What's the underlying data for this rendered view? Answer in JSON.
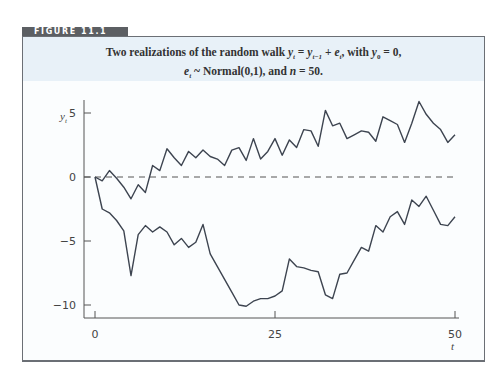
{
  "figure": {
    "tab_label": "FIGURE 11.1",
    "caption_line1_parts": [
      "Two realizations of the random walk ",
      "y",
      "t",
      " = ",
      "y",
      "t−1",
      " + ",
      "e",
      "t",
      ", with ",
      "y",
      "0",
      " = 0,"
    ],
    "caption_line2_parts": [
      "e",
      "t",
      " ~ Normal(0,1), and ",
      "n",
      " = 50."
    ],
    "colors": {
      "tab": "#5c5f63",
      "caption_bg": "#e8f1f8",
      "frame": "#6b6f75",
      "line": "#3d4450"
    }
  },
  "chart_data": {
    "type": "line",
    "xlabel": "t",
    "ylabel": "y_t",
    "xlim": [
      0,
      50
    ],
    "ylim": [
      -11,
      6.5
    ],
    "xticks": [
      0,
      25,
      50
    ],
    "yticks": [
      5,
      0,
      -5,
      -10
    ],
    "reference_line": {
      "y": 0,
      "style": "dashed"
    },
    "grid": false,
    "legend": null,
    "x": [
      0,
      1,
      2,
      3,
      4,
      5,
      6,
      7,
      8,
      9,
      10,
      11,
      12,
      13,
      14,
      15,
      16,
      17,
      18,
      19,
      20,
      21,
      22,
      23,
      24,
      25,
      26,
      27,
      28,
      29,
      30,
      31,
      32,
      33,
      34,
      35,
      36,
      37,
      38,
      39,
      40,
      41,
      42,
      43,
      44,
      45,
      46,
      47,
      48,
      49,
      50
    ],
    "series": [
      {
        "name": "realization 1",
        "values": [
          0,
          -0.3,
          0.5,
          -0.1,
          -0.8,
          -1.7,
          -0.6,
          -1.2,
          0.9,
          0.5,
          2.2,
          1.5,
          0.9,
          2.0,
          1.5,
          2.1,
          1.6,
          1.4,
          0.9,
          2.1,
          2.3,
          1.3,
          3.0,
          1.4,
          2.0,
          3.0,
          1.7,
          2.9,
          2.3,
          3.7,
          3.6,
          2.4,
          5.2,
          4.0,
          4.2,
          3.0,
          3.3,
          3.6,
          3.5,
          2.8,
          4.7,
          4.4,
          4.1,
          2.7,
          4.2,
          5.9,
          4.9,
          4.2,
          3.7,
          2.7,
          3.3
        ]
      },
      {
        "name": "realization 2",
        "values": [
          0,
          -2.5,
          -2.8,
          -3.4,
          -4.2,
          -7.7,
          -4.5,
          -3.8,
          -4.3,
          -3.9,
          -4.3,
          -5.3,
          -4.8,
          -5.5,
          -5.1,
          -3.7,
          -6.0,
          -7.0,
          -8.0,
          -9.0,
          -10.0,
          -10.1,
          -9.7,
          -9.5,
          -9.5,
          -9.3,
          -8.9,
          -6.4,
          -7.0,
          -7.1,
          -7.3,
          -7.4,
          -9.2,
          -9.5,
          -7.6,
          -7.5,
          -6.5,
          -5.5,
          -5.8,
          -3.8,
          -4.3,
          -3.1,
          -2.7,
          -3.7,
          -1.8,
          -2.3,
          -1.5,
          -2.6,
          -3.7,
          -3.8,
          -3.1
        ]
      }
    ]
  }
}
